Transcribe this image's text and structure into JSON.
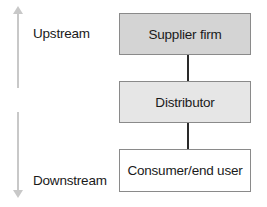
{
  "diagram": {
    "nodes": [
      {
        "label": "Supplier firm",
        "fill": "#d4d4d4"
      },
      {
        "label": "Distributor",
        "fill": "#e6e6e6"
      },
      {
        "label": "Consumer/end user",
        "fill": "#ffffff"
      }
    ],
    "edges": [
      {
        "from": "Supplier firm",
        "to": "Distributor"
      },
      {
        "from": "Distributor",
        "to": "Consumer/end user"
      }
    ],
    "side_labels": {
      "upstream": "Upstream",
      "downstream": "Downstream"
    },
    "colors": {
      "border": "#8a8a8a",
      "connector": "#2a2a2a",
      "arrow": "#c8c8c8"
    }
  }
}
